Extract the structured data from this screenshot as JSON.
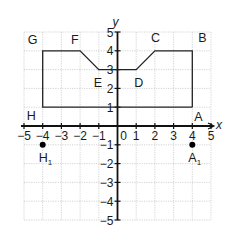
{
  "diagram": {
    "type": "coordinate-grid",
    "axes": {
      "x_label": "x",
      "y_label": "y",
      "x_range": [
        -5,
        5
      ],
      "y_range": [
        -5,
        5
      ],
      "x_ticks": [
        "−5",
        "−4",
        "−3",
        "−2",
        "−1",
        "0",
        "1",
        "2",
        "3",
        "4",
        "5"
      ],
      "y_ticks_pos": [
        "1",
        "2",
        "3",
        "4",
        "5"
      ],
      "y_ticks_neg": [
        "−1",
        "−2",
        "−3",
        "−4",
        "−5"
      ]
    },
    "shape": {
      "name": "ABCDEFGH",
      "vertices": [
        {
          "label": "A",
          "x": 4,
          "y": 1
        },
        {
          "label": "B",
          "x": 4,
          "y": 4
        },
        {
          "label": "C",
          "x": 2,
          "y": 4
        },
        {
          "label": "D",
          "x": 1,
          "y": 3
        },
        {
          "label": "E",
          "x": -1,
          "y": 3
        },
        {
          "label": "F",
          "x": -2,
          "y": 4
        },
        {
          "label": "G",
          "x": -4,
          "y": 4
        },
        {
          "label": "H",
          "x": -4,
          "y": 1
        }
      ]
    },
    "points": [
      {
        "label": "H",
        "sub": "1",
        "x": -4,
        "y": -1
      },
      {
        "label": "A",
        "sub": "1",
        "x": 4,
        "y": -1
      }
    ],
    "colors": {
      "axis": "#111111",
      "grid": "#c8c8c8",
      "shape": "#222222",
      "point": "#000000"
    }
  }
}
